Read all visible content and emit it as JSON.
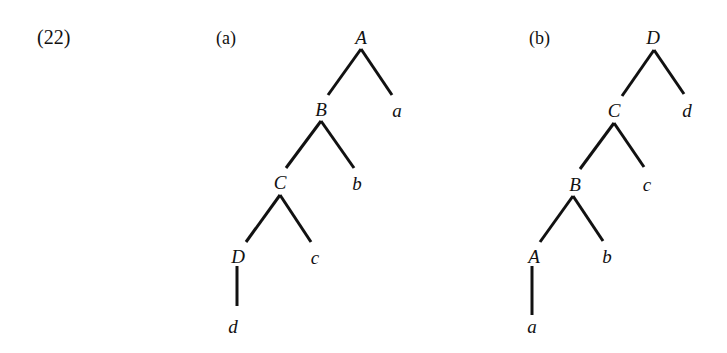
{
  "example_number": "(22)",
  "trees": [
    {
      "label": "(a)",
      "nodes": [
        {
          "id": "A",
          "text": "A",
          "x": 361,
          "y": 37,
          "type": "internal"
        },
        {
          "id": "B",
          "text": "B",
          "x": 321,
          "y": 109,
          "type": "internal"
        },
        {
          "id": "a",
          "text": "a",
          "x": 397,
          "y": 110,
          "type": "leaf"
        },
        {
          "id": "C",
          "text": "C",
          "x": 280,
          "y": 182,
          "type": "internal"
        },
        {
          "id": "b",
          "text": "b",
          "x": 357,
          "y": 183,
          "type": "leaf"
        },
        {
          "id": "D",
          "text": "D",
          "x": 238,
          "y": 256,
          "type": "internal"
        },
        {
          "id": "c",
          "text": "c",
          "x": 315,
          "y": 257,
          "type": "leaf"
        },
        {
          "id": "d",
          "text": "d",
          "x": 233,
          "y": 326,
          "type": "leaf"
        }
      ],
      "edges": [
        {
          "from": "A",
          "to": "B",
          "x1": 361,
          "y1": 49,
          "x2": 328,
          "y2": 95
        },
        {
          "from": "A",
          "to": "a",
          "x1": 361,
          "y1": 49,
          "x2": 392,
          "y2": 95
        },
        {
          "from": "B",
          "to": "C",
          "x1": 321,
          "y1": 121,
          "x2": 286,
          "y2": 168
        },
        {
          "from": "B",
          "to": "b",
          "x1": 321,
          "y1": 121,
          "x2": 354,
          "y2": 168
        },
        {
          "from": "C",
          "to": "D",
          "x1": 280,
          "y1": 195,
          "x2": 246,
          "y2": 242
        },
        {
          "from": "C",
          "to": "c",
          "x1": 280,
          "y1": 195,
          "x2": 311,
          "y2": 242
        },
        {
          "from": "D",
          "to": "d",
          "x1": 237,
          "y1": 266,
          "x2": 237,
          "y2": 306
        }
      ]
    },
    {
      "label": "(b)",
      "nodes": [
        {
          "id": "D",
          "text": "D",
          "x": 653,
          "y": 37,
          "type": "internal"
        },
        {
          "id": "C",
          "text": "C",
          "x": 614,
          "y": 110,
          "type": "internal"
        },
        {
          "id": "d",
          "text": "d",
          "x": 687,
          "y": 110,
          "type": "leaf"
        },
        {
          "id": "B",
          "text": "B",
          "x": 575,
          "y": 184,
          "type": "internal"
        },
        {
          "id": "c",
          "text": "c",
          "x": 647,
          "y": 184,
          "type": "leaf"
        },
        {
          "id": "A",
          "text": "A",
          "x": 534,
          "y": 256,
          "type": "internal"
        },
        {
          "id": "b",
          "text": "b",
          "x": 607,
          "y": 256,
          "type": "leaf"
        },
        {
          "id": "a",
          "text": "a",
          "x": 532,
          "y": 326,
          "type": "leaf"
        }
      ],
      "edges": [
        {
          "from": "D",
          "to": "C",
          "x1": 654,
          "y1": 50,
          "x2": 622,
          "y2": 96
        },
        {
          "from": "D",
          "to": "d",
          "x1": 654,
          "y1": 50,
          "x2": 684,
          "y2": 94
        },
        {
          "from": "C",
          "to": "B",
          "x1": 614,
          "y1": 123,
          "x2": 580,
          "y2": 169
        },
        {
          "from": "C",
          "to": "c",
          "x1": 614,
          "y1": 123,
          "x2": 644,
          "y2": 167
        },
        {
          "from": "B",
          "to": "A",
          "x1": 573,
          "y1": 196,
          "x2": 540,
          "y2": 242
        },
        {
          "from": "B",
          "to": "b",
          "x1": 573,
          "y1": 196,
          "x2": 603,
          "y2": 241
        },
        {
          "from": "A",
          "to": "a",
          "x1": 532,
          "y1": 266,
          "x2": 532,
          "y2": 315
        }
      ]
    }
  ]
}
